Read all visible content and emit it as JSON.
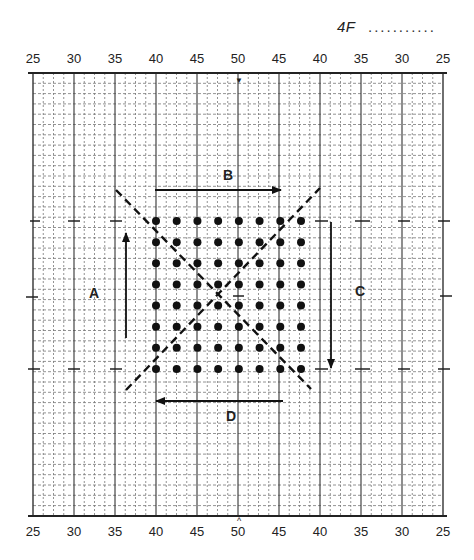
{
  "header": {
    "page_ref": "4F",
    "page_dots": "..........."
  },
  "chart_data": {
    "type": "scatter",
    "x_axis_top_labels": [
      "25",
      "30",
      "35",
      "40",
      "45",
      "50",
      "45",
      "40",
      "35",
      "30",
      "25"
    ],
    "x_axis_bottom_labels": [
      "25",
      "30",
      "35",
      "40",
      "45",
      "50",
      "45",
      "40",
      "35",
      "30",
      "25"
    ],
    "center_marker_top": "▼",
    "center_marker_bottom": "^",
    "grid": {
      "major_every": 5,
      "minor_every": 1,
      "on": true
    },
    "dot_grid": {
      "columns": 8,
      "rows": 8,
      "x_range_labels": [
        "40",
        "46"
      ],
      "count": 64
    },
    "diagonals": [
      {
        "style": "dashed",
        "from": "top-left",
        "to": "bottom-right"
      },
      {
        "style": "dashed",
        "from": "bottom-left",
        "to": "top-right"
      }
    ],
    "arrows": [
      {
        "label": "A",
        "direction": "up",
        "position": "left of dots"
      },
      {
        "label": "B",
        "direction": "right",
        "position": "above dots"
      },
      {
        "label": "C",
        "direction": "down",
        "position": "right of dots"
      },
      {
        "label": "D",
        "direction": "left",
        "position": "below dots"
      }
    ]
  },
  "labels": {
    "A": "A",
    "B": "B",
    "C": "C",
    "D": "D",
    "top_marker": "▼",
    "bottom_marker": "^"
  },
  "axis": {
    "top": [
      "25",
      "30",
      "35",
      "40",
      "45",
      "50",
      "45",
      "40",
      "35",
      "30",
      "25"
    ],
    "bottom": [
      "25",
      "30",
      "35",
      "40",
      "45",
      "50",
      "45",
      "40",
      "35",
      "30",
      "25"
    ]
  }
}
